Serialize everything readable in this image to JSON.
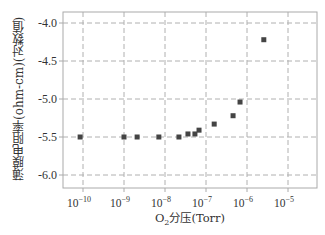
{
  "chart_data": {
    "type": "scatter",
    "title": "",
    "xlabel": "O₂分压(Torr)",
    "ylabel": "薄膜电阻率(ohm-cm)(对数值)",
    "xscale": "log",
    "xlim_log10": [
      -10.5,
      -4.5
    ],
    "ylim": [
      -6.15,
      -3.9
    ],
    "grid": true,
    "grid_style": "dashed",
    "legend": null,
    "x_ticks_log10": [
      -10,
      -9,
      -8,
      -7,
      -6,
      -5
    ],
    "x_tick_labels": [
      "10^-10",
      "10^-9",
      "10^-8",
      "10^-7",
      "10^-6",
      "10^-5"
    ],
    "y_ticks": [
      -4.0,
      -4.5,
      -5.0,
      -5.5,
      -6.0
    ],
    "y_tick_labels": [
      "-4.0",
      "-4.5",
      "-5.0",
      "-5.5",
      "-6.0"
    ],
    "series": [
      {
        "name": "薄膜电阻率",
        "marker": "square",
        "color": "#444444",
        "x_log10": [
          -10.07,
          -9.0,
          -8.68,
          -8.15,
          -7.66,
          -7.44,
          -7.27,
          -7.17,
          -6.8,
          -6.34,
          -6.17,
          -5.59
        ],
        "y": [
          -5.5,
          -5.5,
          -5.5,
          -5.5,
          -5.5,
          -5.46,
          -5.46,
          -5.41,
          -5.33,
          -5.22,
          -5.04,
          -4.22
        ]
      }
    ]
  },
  "labels": {
    "ylabel": "薄膜电阻率(ohm-cm)(对数值)",
    "xlabel_prefix": "O",
    "xlabel_sub": "2",
    "xlabel_suffix": "分压(Torr)"
  },
  "colors": {
    "frame": "#aaaaaa",
    "grid": "#b0b0b0",
    "marker": "#444444",
    "text": "#333333"
  }
}
